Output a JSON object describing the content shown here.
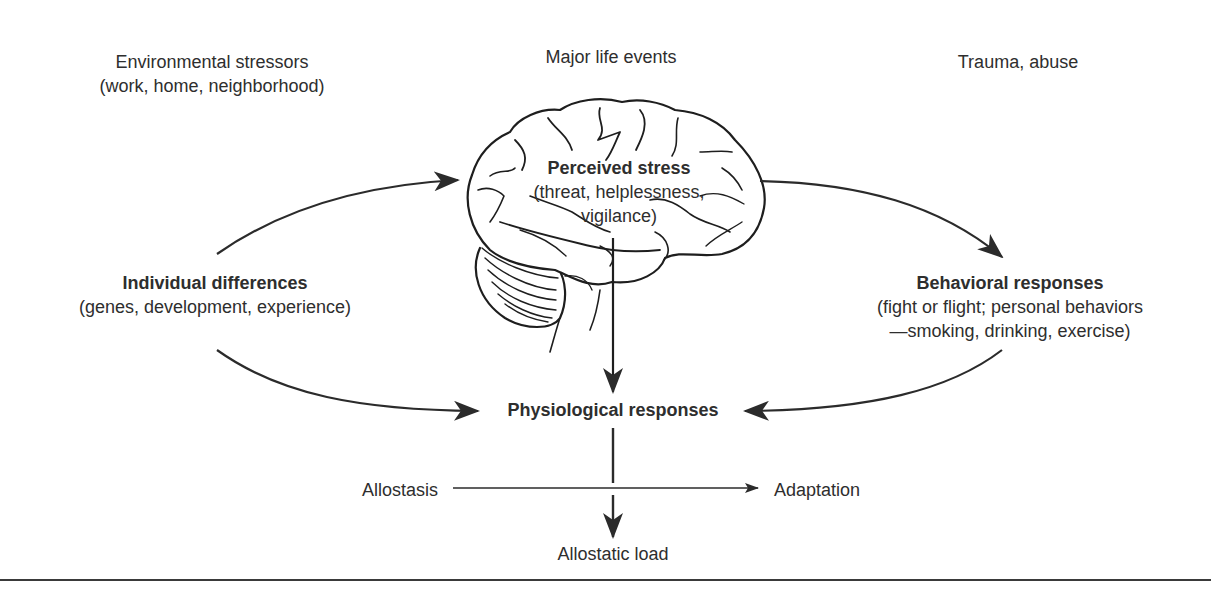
{
  "diagram": {
    "stressors": [
      {
        "line1": "Environmental stressors",
        "line2": "(work, home, neighborhood)"
      },
      {
        "line1": "Major life events"
      },
      {
        "line1": "Trauma, abuse"
      }
    ],
    "perceived_stress": {
      "title": "Perceived stress",
      "line1": "(threat, helplessness,",
      "line2": "vigilance)"
    },
    "individual_differences": {
      "title": "Individual differences",
      "subtitle": "(genes, development, experience)"
    },
    "behavioral_responses": {
      "title": "Behavioral responses",
      "line1": "(fight or flight; personal behaviors",
      "line2": "—smoking, drinking, exercise)"
    },
    "physiological_responses": {
      "title": "Physiological responses"
    },
    "allostasis": "Allostasis",
    "adaptation": "Adaptation",
    "allostatic_load": "Allostatic load",
    "colors": {
      "ink": "#2b2b2b",
      "background": "#ffffff"
    }
  }
}
